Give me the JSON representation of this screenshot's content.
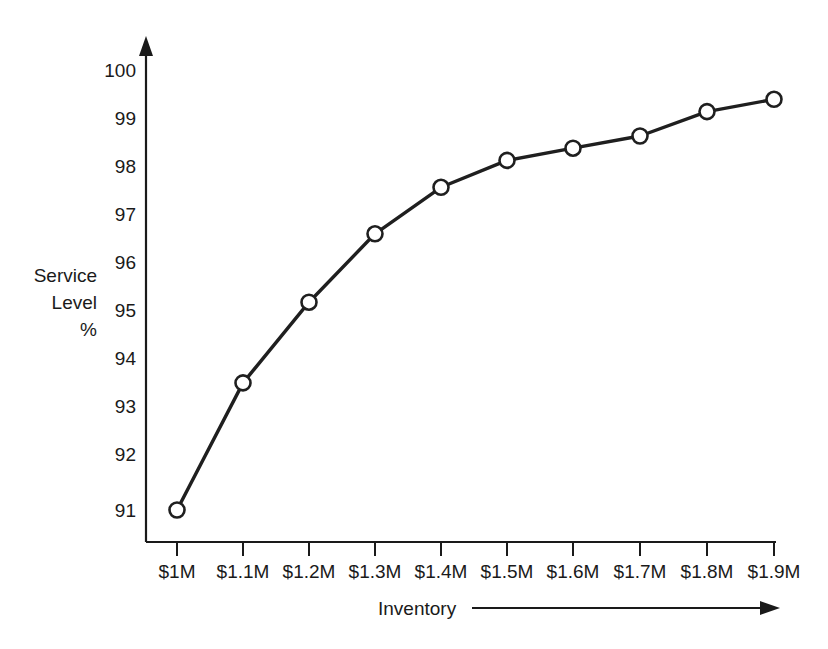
{
  "chart_data": {
    "type": "line",
    "title": "",
    "xlabel": "Inventory",
    "ylabel": "Service Level %",
    "categories": [
      "$1M",
      "$1.1M",
      "$1.2M",
      "$1.3M",
      "$1.4M",
      "$1.5M",
      "$1.6M",
      "$1.7M",
      "$1.8M",
      "$1.9M"
    ],
    "values": [
      91.0,
      93.6,
      95.25,
      96.65,
      97.6,
      98.15,
      98.4,
      98.65,
      99.15,
      99.4
    ],
    "series": [
      {
        "name": "Service Level",
        "values": [
          91.0,
          93.6,
          95.25,
          96.65,
          97.6,
          98.15,
          98.4,
          98.65,
          99.15,
          99.4
        ]
      }
    ],
    "ylim": [
      90.5,
      100.2
    ],
    "yticks": [
      91,
      92,
      93,
      94,
      95,
      96,
      97,
      98,
      99,
      100
    ],
    "ytick_labels": [
      "91",
      "92",
      "93",
      "94",
      "95",
      "96",
      "97",
      "98",
      "99",
      "100"
    ],
    "xtick_labels": [
      "$1M",
      "$1.1M",
      "$1.2M",
      "$1.3M",
      "$1.4M",
      "$1.5M",
      "$1.6M",
      "$1.7M",
      "$1.8M",
      "$1.9M"
    ],
    "grid": false,
    "legend": "none",
    "marker": "open-circle",
    "line_color": "#1f1f1f",
    "marker_fill": "#ffffff",
    "background": "#ffffff",
    "y_axis_arrow": true,
    "x_axis_arrow_annotation": true
  },
  "axis": {
    "y_title_lines": [
      "Service",
      "Level",
      "%"
    ],
    "x_title": "Inventory"
  },
  "ytick_labels": {
    "t0": "100",
    "t1": "99",
    "t2": "98",
    "t3": "97",
    "t4": "96",
    "t5": "95",
    "t6": "94",
    "t7": "93",
    "t8": "92",
    "t9": "91"
  },
  "xtick_labels": {
    "t0": "$1M",
    "t1": "$1.1M",
    "t2": "$1.2M",
    "t3": "$1.3M",
    "t4": "$1.4M",
    "t5": "$1.5M",
    "t6": "$1.6M",
    "t7": "$1.7M",
    "t8": "$1.8M",
    "t9": "$1.9M"
  }
}
